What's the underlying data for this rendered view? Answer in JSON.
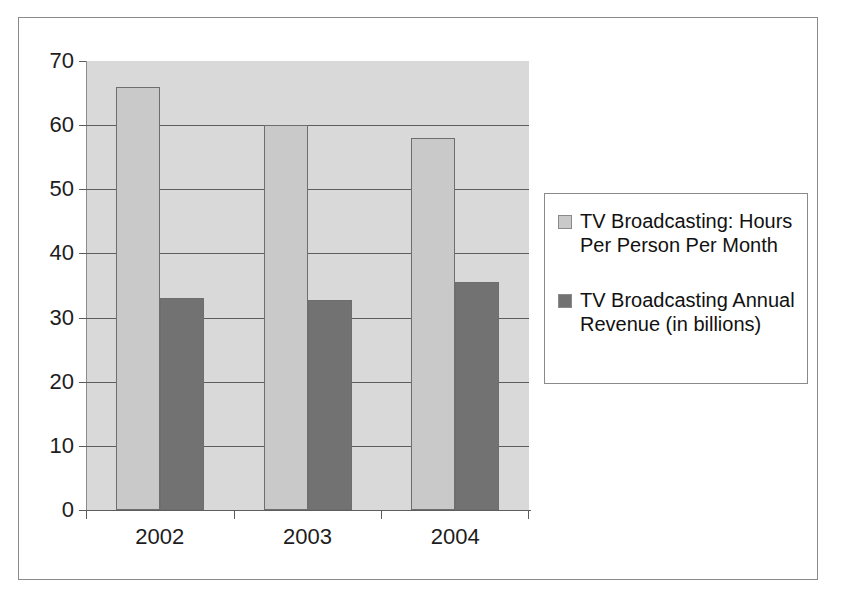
{
  "chart_data": {
    "type": "bar",
    "title": "",
    "xlabel": "",
    "ylabel": "",
    "categories": [
      "2002",
      "2003",
      "2004"
    ],
    "series": [
      {
        "name": "TV Broadcasting: Hours Per Person Per Month",
        "color": "#c9c9c9",
        "values": [
          66,
          60,
          58
        ]
      },
      {
        "name": "TV Broadcasting Annual Revenue (in billions)",
        "color": "#727272",
        "values": [
          33,
          32.7,
          35.6
        ]
      }
    ],
    "ylim": [
      0,
      70
    ],
    "ytick_labels": [
      "0",
      "10",
      "20",
      "30",
      "40",
      "50",
      "60",
      "70"
    ],
    "ytick_values": [
      0,
      10,
      20,
      30,
      40,
      50,
      60,
      70
    ],
    "grid": true,
    "legend_position": "right",
    "plot_background_color": "#d9d9d9",
    "frame_border_color": "#8a8a8a"
  },
  "legend": {
    "entries": [
      {
        "label": "TV Broadcasting: Hours Per Person Per Month",
        "swatch": "legend-swatch-series-0"
      },
      {
        "label": "TV Broadcasting Annual Revenue (in billions)",
        "swatch": "legend-swatch-series-1"
      }
    ]
  }
}
